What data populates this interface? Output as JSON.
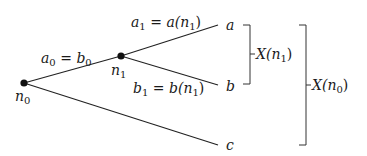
{
  "diagram": {
    "type": "game-tree",
    "nodes": [
      {
        "id": "n0",
        "label": "n",
        "sub": "0",
        "x": 24,
        "y": 83
      },
      {
        "id": "n1",
        "label": "n",
        "sub": "1",
        "x": 121,
        "y": 56
      }
    ],
    "leaves": [
      {
        "id": "a",
        "label": "a",
        "x": 230,
        "y": 25
      },
      {
        "id": "b",
        "label": "b",
        "x": 230,
        "y": 86
      },
      {
        "id": "c",
        "label": "c",
        "x": 230,
        "y": 145
      }
    ],
    "edges": [
      {
        "from": "n0",
        "to": "n1",
        "label_parts": [
          "a",
          "0",
          " = ",
          "b",
          "0"
        ]
      },
      {
        "from": "n1",
        "to": "a",
        "label_parts": [
          "a",
          "1",
          " = ",
          "a(n",
          "1",
          ")"
        ]
      },
      {
        "from": "n1",
        "to": "b",
        "label_parts": [
          "b",
          "1",
          " = ",
          "b(n",
          "1",
          ")"
        ]
      },
      {
        "from": "n0",
        "to": "c",
        "label_parts": []
      }
    ],
    "brackets": [
      {
        "id": "X_n1",
        "label": "X(n",
        "sub": "1",
        "close": ")",
        "covers": [
          "a",
          "b"
        ]
      },
      {
        "id": "X_n0",
        "label": "X(n",
        "sub": "0",
        "close": ")",
        "covers": [
          "a",
          "b",
          "c"
        ]
      }
    ]
  },
  "text": {
    "n0": "n",
    "n0_sub": "0",
    "n1": "n",
    "n1_sub": "1",
    "leaf_a": "a",
    "leaf_b": "b",
    "leaf_c": "c",
    "e0_a": "a",
    "e0_a_sub": "0",
    "e0_eq": " = ",
    "e0_b": "b",
    "e0_b_sub": "0",
    "e1_a": "a",
    "e1_a_sub": "1",
    "e1_eq": " = ",
    "e1_fn": "a(n",
    "e1_fn_sub": "1",
    "e1_close": ")",
    "e2_b": "b",
    "e2_b_sub": "1",
    "e2_eq": " = ",
    "e2_fn": "b(n",
    "e2_fn_sub": "1",
    "e2_close": ")",
    "x1": "X(n",
    "x1_sub": "1",
    "x1_close": ")",
    "x0": "X(n",
    "x0_sub": "0",
    "x0_close": ")"
  }
}
